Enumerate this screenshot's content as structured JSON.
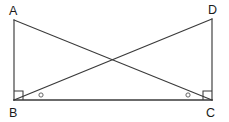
{
  "figure": {
    "background_color": "#ffffff",
    "line_color": "#3a3a3a",
    "label_color": "#1a1a1a",
    "vertices": [
      {
        "id": "A",
        "label": "A",
        "x": 14,
        "y": 20,
        "label_x": 9,
        "label_y": 15
      },
      {
        "id": "D",
        "label": "D",
        "x": 212,
        "y": 19,
        "label_x": 208,
        "label_y": 14
      },
      {
        "id": "B",
        "label": "B",
        "x": 14,
        "y": 100,
        "label_x": 9,
        "label_y": 117
      },
      {
        "id": "C",
        "label": "C",
        "x": 212,
        "y": 100,
        "label_x": 206,
        "label_y": 117
      }
    ],
    "segments": [
      {
        "name": "AB",
        "from": "A",
        "to": "B",
        "kind": "side"
      },
      {
        "name": "DC",
        "from": "D",
        "to": "C",
        "kind": "side"
      },
      {
        "name": "BC",
        "from": "B",
        "to": "C",
        "kind": "base"
      },
      {
        "name": "AC",
        "from": "A",
        "to": "C",
        "kind": "diagonal"
      },
      {
        "name": "BD",
        "from": "B",
        "to": "D",
        "kind": "diagonal"
      }
    ],
    "intersection": {
      "name": "diagonal-crossing",
      "x": 113,
      "y": 60
    },
    "right_angle_marks": [
      {
        "at": "B",
        "symbol": "square",
        "size": 9
      },
      {
        "at": "C",
        "symbol": "square",
        "size": 9
      }
    ],
    "angle_marks": [
      {
        "name": "angle-mark-at-B",
        "symbol": "circle",
        "x": 41,
        "y": 95,
        "r": 2.1
      },
      {
        "name": "angle-mark-at-C",
        "symbol": "circle",
        "x": 188,
        "y": 95,
        "r": 2.1
      }
    ]
  }
}
